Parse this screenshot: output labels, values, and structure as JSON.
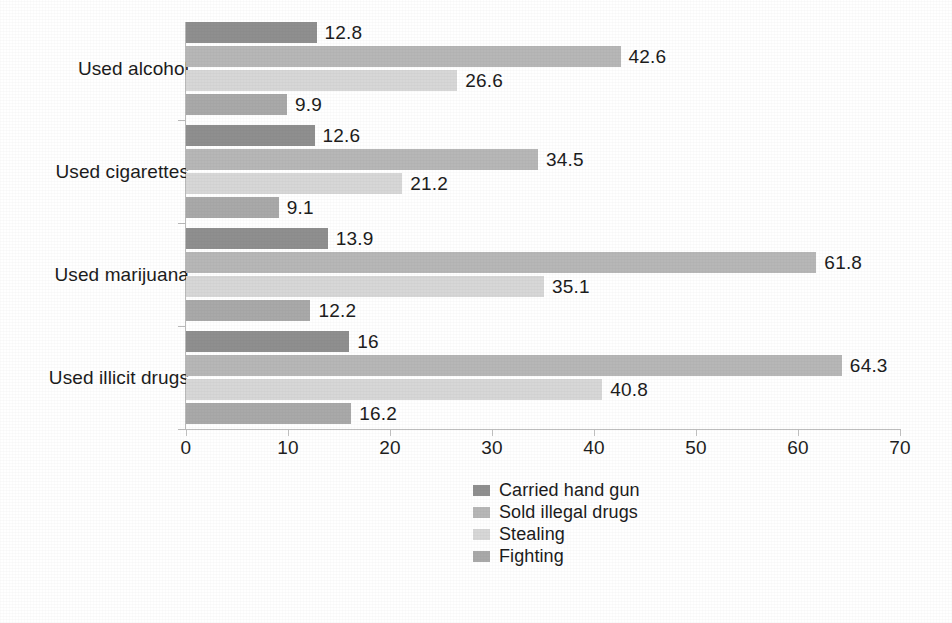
{
  "chart_data": {
    "type": "bar",
    "orientation": "horizontal",
    "title": "",
    "xlabel": "",
    "ylabel": "",
    "xlim": [
      0,
      70
    ],
    "xticks": [
      0,
      10,
      20,
      30,
      40,
      50,
      60,
      70
    ],
    "xtick_labels": [
      "0",
      "10",
      "20",
      "30",
      "40",
      "50",
      "60",
      "70"
    ],
    "grid": false,
    "legend_position": "bottom-center",
    "categories": [
      "Used alcohol",
      "Used cigarettes",
      "Used marijuana",
      "Used illicit drugs"
    ],
    "series": [
      {
        "name": "Carried hand gun",
        "color": "#8f8f8f",
        "values": [
          12.8,
          12.6,
          13.9,
          16
        ],
        "labels": [
          "12.8",
          "12.6",
          "13.9",
          "16"
        ]
      },
      {
        "name": "Sold illegal drugs",
        "color": "#b7b7b7",
        "values": [
          42.6,
          34.5,
          61.8,
          64.3
        ],
        "labels": [
          "42.6",
          "34.5",
          "61.8",
          "64.3"
        ]
      },
      {
        "name": "Stealing",
        "color": "#d7d7d7",
        "values": [
          26.6,
          21.2,
          35.1,
          40.8
        ],
        "labels": [
          "26.6",
          "21.2",
          "35.1",
          "40.8"
        ]
      },
      {
        "name": "Fighting",
        "color": "#a9a9a9",
        "values": [
          9.9,
          9.1,
          12.2,
          16.2
        ],
        "labels": [
          "9.9",
          "9.1",
          "12.2",
          "16.2"
        ]
      }
    ]
  },
  "legend": {
    "items": [
      {
        "label": "Carried hand gun",
        "color": "#8f8f8f"
      },
      {
        "label": "Sold illegal drugs",
        "color": "#b7b7b7"
      },
      {
        "label": "Stealing",
        "color": "#d7d7d7"
      },
      {
        "label": "Fighting",
        "color": "#a9a9a9"
      }
    ]
  },
  "axis": {
    "x_tick_labels": [
      "0",
      "10",
      "20",
      "30",
      "40",
      "50",
      "60",
      "70"
    ],
    "y_category_labels": [
      "Used alcohol",
      "Used cigarettes",
      "Used marijuana",
      "Used illicit drugs"
    ]
  }
}
